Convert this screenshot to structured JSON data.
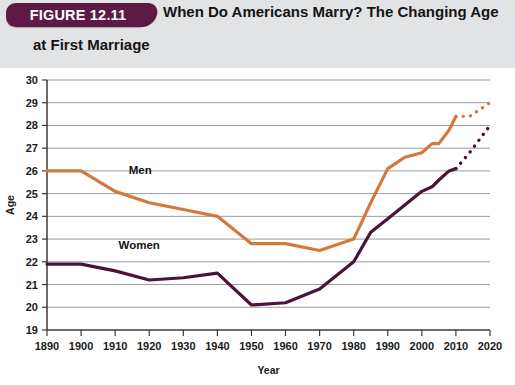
{
  "header": {
    "badge_label": "FIGURE 12.11",
    "title_line1": "When Do Americans Marry? The Changing Age",
    "title_line2": "at First Marriage"
  },
  "colors": {
    "men": "#d4793c",
    "women": "#4d1238",
    "badge": "#5c1a45",
    "header_band": "#e2e3e5",
    "grid": "#8e9196",
    "axis": "#3a3a3a"
  },
  "labels": {
    "men": "Men",
    "women": "Women"
  },
  "chart_data": {
    "type": "line",
    "title": "When Do Americans Marry? The Changing Age at First Marriage",
    "xlabel": "Year",
    "ylabel": "Age",
    "xlim": [
      1890,
      2020
    ],
    "ylim": [
      19,
      30
    ],
    "xticks": [
      1890,
      1900,
      1910,
      1920,
      1930,
      1940,
      1950,
      1960,
      1970,
      1980,
      1990,
      2000,
      2010,
      2020
    ],
    "yticks": [
      19,
      20,
      21,
      22,
      23,
      24,
      25,
      26,
      27,
      28,
      29,
      30
    ],
    "grid": true,
    "legend": "inline-labels",
    "series": [
      {
        "name": "Men",
        "color": "#d4793c",
        "style": "solid",
        "x": [
          1890,
          1900,
          1910,
          1920,
          1930,
          1940,
          1950,
          1960,
          1970,
          1980,
          1985,
          1990,
          1995,
          2000,
          2003,
          2005,
          2008,
          2010
        ],
        "values": [
          26.0,
          26.0,
          25.1,
          24.6,
          24.3,
          24.0,
          22.8,
          22.8,
          22.5,
          23.0,
          24.6,
          26.1,
          26.6,
          26.8,
          27.2,
          27.2,
          27.8,
          28.4
        ]
      },
      {
        "name": "Men (projected)",
        "color": "#d4793c",
        "style": "dotted",
        "x": [
          2010,
          2014,
          2017,
          2020
        ],
        "values": [
          28.4,
          28.4,
          28.7,
          29.0
        ]
      },
      {
        "name": "Women",
        "color": "#4d1238",
        "style": "solid",
        "x": [
          1890,
          1900,
          1910,
          1920,
          1930,
          1940,
          1950,
          1960,
          1970,
          1980,
          1985,
          1990,
          1995,
          2000,
          2003,
          2005,
          2008,
          2010
        ],
        "values": [
          21.9,
          21.9,
          21.6,
          21.2,
          21.3,
          21.5,
          20.1,
          20.2,
          20.8,
          22.0,
          23.3,
          23.9,
          24.5,
          25.1,
          25.3,
          25.6,
          26.0,
          26.1
        ]
      },
      {
        "name": "Women (projected)",
        "color": "#4d1238",
        "style": "dotted",
        "x": [
          2010,
          2014,
          2017,
          2020
        ],
        "values": [
          26.1,
          26.8,
          27.4,
          28.0
        ]
      }
    ]
  }
}
